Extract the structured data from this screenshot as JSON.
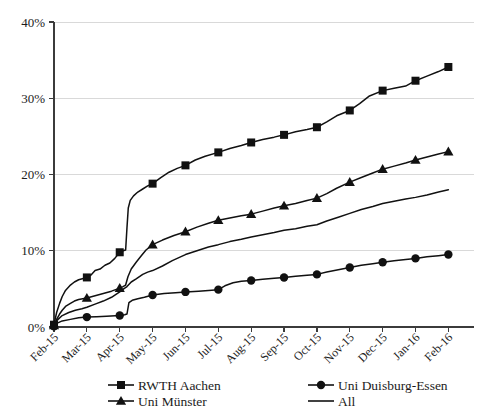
{
  "chart_data": {
    "type": "line",
    "title": "",
    "xlabel": "",
    "ylabel": "",
    "ylim": [
      0,
      40
    ],
    "ytick_labels": [
      "0%",
      "10%",
      "20%",
      "30%",
      "40%"
    ],
    "ytick_values": [
      0,
      10,
      20,
      30,
      40
    ],
    "grid": true,
    "legend_position": "bottom",
    "categories": [
      "Feb-15",
      "Mar-15",
      "Apr-15",
      "May-15",
      "Jun-15",
      "Jul-15",
      "Aug-15",
      "Sep-15",
      "Oct-15",
      "Nov-15",
      "Dec-15",
      "Jan-16",
      "Feb-16"
    ],
    "series": [
      {
        "name": "RWTH Aachen",
        "marker": "square",
        "values": [
          0.3,
          6.5,
          9.8,
          18.8,
          21.2,
          22.9,
          24.2,
          25.2,
          26.2,
          28.4,
          31.0,
          32.3,
          34.1
        ]
      },
      {
        "name": "Uni Münster",
        "marker": "triangle",
        "values": [
          0.2,
          3.8,
          5.1,
          10.8,
          12.5,
          14.0,
          14.8,
          15.9,
          16.9,
          19.0,
          20.7,
          21.9,
          23.0
        ]
      },
      {
        "name": "Uni Duisburg-Essen",
        "marker": "circle",
        "values": [
          0.1,
          1.3,
          1.5,
          4.2,
          4.6,
          4.9,
          6.1,
          6.5,
          6.9,
          7.8,
          8.5,
          9.0,
          9.5
        ]
      },
      {
        "name": "All",
        "marker": "none",
        "values": [
          0.2,
          2.6,
          4.6,
          7.4,
          9.5,
          10.8,
          11.8,
          12.7,
          13.4,
          14.9,
          16.2,
          17.0,
          18.0
        ]
      }
    ],
    "dense_points": {
      "RWTH Aachen": [
        [
          0.0,
          0.3
        ],
        [
          0.08,
          1.9
        ],
        [
          0.17,
          3.1
        ],
        [
          0.25,
          4.0
        ],
        [
          0.35,
          4.8
        ],
        [
          0.5,
          5.5
        ],
        [
          0.62,
          5.9
        ],
        [
          0.75,
          6.2
        ],
        [
          1.0,
          6.5
        ],
        [
          1.12,
          6.8
        ],
        [
          1.25,
          7.4
        ],
        [
          1.4,
          7.6
        ],
        [
          1.55,
          8.1
        ],
        [
          1.7,
          8.4
        ],
        [
          1.85,
          9.0
        ],
        [
          2.0,
          9.8
        ],
        [
          2.1,
          10.0
        ],
        [
          2.18,
          10.1
        ],
        [
          2.22,
          13.0
        ],
        [
          2.26,
          15.6
        ],
        [
          2.32,
          16.6
        ],
        [
          2.42,
          17.2
        ],
        [
          2.55,
          17.7
        ],
        [
          2.7,
          18.1
        ],
        [
          2.85,
          18.5
        ],
        [
          3.0,
          18.8
        ],
        [
          3.25,
          19.6
        ],
        [
          3.5,
          20.3
        ],
        [
          3.75,
          20.8
        ],
        [
          4.0,
          21.2
        ],
        [
          4.3,
          21.9
        ],
        [
          4.6,
          22.4
        ],
        [
          5.0,
          22.9
        ],
        [
          5.35,
          23.4
        ],
        [
          5.7,
          23.8
        ],
        [
          6.0,
          24.2
        ],
        [
          6.35,
          24.6
        ],
        [
          6.7,
          24.9
        ],
        [
          7.0,
          25.2
        ],
        [
          7.35,
          25.6
        ],
        [
          7.7,
          25.9
        ],
        [
          8.0,
          26.2
        ],
        [
          8.3,
          26.9
        ],
        [
          8.6,
          27.7
        ],
        [
          9.0,
          28.4
        ],
        [
          9.3,
          29.3
        ],
        [
          9.6,
          30.3
        ],
        [
          10.0,
          31.0
        ],
        [
          10.35,
          31.3
        ],
        [
          10.7,
          31.6
        ],
        [
          11.0,
          32.3
        ],
        [
          11.35,
          32.9
        ],
        [
          11.7,
          33.5
        ],
        [
          12.0,
          34.1
        ]
      ],
      "Uni Münster": [
        [
          0.0,
          0.2
        ],
        [
          0.08,
          1.0
        ],
        [
          0.17,
          1.7
        ],
        [
          0.25,
          2.2
        ],
        [
          0.35,
          2.7
        ],
        [
          0.5,
          3.1
        ],
        [
          0.62,
          3.4
        ],
        [
          0.75,
          3.6
        ],
        [
          1.0,
          3.8
        ],
        [
          1.25,
          4.1
        ],
        [
          1.5,
          4.4
        ],
        [
          1.75,
          4.7
        ],
        [
          2.0,
          5.1
        ],
        [
          2.1,
          5.3
        ],
        [
          2.18,
          5.5
        ],
        [
          2.25,
          6.6
        ],
        [
          2.35,
          7.6
        ],
        [
          2.5,
          8.5
        ],
        [
          2.65,
          9.3
        ],
        [
          2.8,
          10.1
        ],
        [
          3.0,
          10.8
        ],
        [
          3.3,
          11.4
        ],
        [
          3.65,
          12.0
        ],
        [
          4.0,
          12.5
        ],
        [
          4.35,
          13.1
        ],
        [
          4.7,
          13.6
        ],
        [
          5.0,
          14.0
        ],
        [
          5.35,
          14.3
        ],
        [
          5.7,
          14.6
        ],
        [
          6.0,
          14.8
        ],
        [
          6.35,
          15.2
        ],
        [
          6.7,
          15.6
        ],
        [
          7.0,
          15.9
        ],
        [
          7.35,
          16.2
        ],
        [
          7.7,
          16.6
        ],
        [
          8.0,
          16.9
        ],
        [
          8.3,
          17.5
        ],
        [
          8.6,
          18.2
        ],
        [
          9.0,
          19.0
        ],
        [
          9.35,
          19.6
        ],
        [
          9.7,
          20.2
        ],
        [
          10.0,
          20.7
        ],
        [
          10.35,
          21.1
        ],
        [
          10.7,
          21.5
        ],
        [
          11.0,
          21.9
        ],
        [
          11.35,
          22.3
        ],
        [
          11.7,
          22.7
        ],
        [
          12.0,
          23.0
        ]
      ],
      "Uni Duisburg-Essen": [
        [
          0.0,
          0.1
        ],
        [
          0.1,
          0.5
        ],
        [
          0.25,
          0.8
        ],
        [
          0.5,
          1.0
        ],
        [
          0.75,
          1.2
        ],
        [
          1.0,
          1.3
        ],
        [
          1.3,
          1.35
        ],
        [
          1.6,
          1.4
        ],
        [
          2.0,
          1.5
        ],
        [
          2.15,
          1.6
        ],
        [
          2.22,
          1.7
        ],
        [
          2.28,
          3.2
        ],
        [
          2.38,
          3.5
        ],
        [
          2.55,
          3.7
        ],
        [
          2.75,
          3.9
        ],
        [
          3.0,
          4.2
        ],
        [
          3.35,
          4.4
        ],
        [
          3.7,
          4.5
        ],
        [
          4.0,
          4.6
        ],
        [
          4.4,
          4.7
        ],
        [
          4.7,
          4.8
        ],
        [
          5.0,
          4.9
        ],
        [
          5.2,
          5.4
        ],
        [
          5.45,
          5.8
        ],
        [
          5.7,
          6.0
        ],
        [
          6.0,
          6.1
        ],
        [
          6.35,
          6.25
        ],
        [
          6.7,
          6.4
        ],
        [
          7.0,
          6.5
        ],
        [
          7.35,
          6.65
        ],
        [
          7.7,
          6.8
        ],
        [
          8.0,
          6.9
        ],
        [
          8.3,
          7.2
        ],
        [
          8.65,
          7.5
        ],
        [
          9.0,
          7.8
        ],
        [
          9.35,
          8.1
        ],
        [
          9.7,
          8.3
        ],
        [
          10.0,
          8.5
        ],
        [
          10.35,
          8.7
        ],
        [
          10.7,
          8.85
        ],
        [
          11.0,
          9.0
        ],
        [
          11.35,
          9.2
        ],
        [
          11.7,
          9.35
        ],
        [
          12.0,
          9.5
        ]
      ],
      "All": [
        [
          0.0,
          0.2
        ],
        [
          0.1,
          0.9
        ],
        [
          0.25,
          1.5
        ],
        [
          0.45,
          1.9
        ],
        [
          0.65,
          2.2
        ],
        [
          0.85,
          2.4
        ],
        [
          1.0,
          2.6
        ],
        [
          1.25,
          3.0
        ],
        [
          1.5,
          3.4
        ],
        [
          1.75,
          3.9
        ],
        [
          2.0,
          4.6
        ],
        [
          2.12,
          5.0
        ],
        [
          2.22,
          5.3
        ],
        [
          2.35,
          5.9
        ],
        [
          2.5,
          6.3
        ],
        [
          2.7,
          6.9
        ],
        [
          2.85,
          7.2
        ],
        [
          3.0,
          7.4
        ],
        [
          3.3,
          8.0
        ],
        [
          3.6,
          8.7
        ],
        [
          4.0,
          9.5
        ],
        [
          4.35,
          10.0
        ],
        [
          4.7,
          10.5
        ],
        [
          5.0,
          10.8
        ],
        [
          5.35,
          11.2
        ],
        [
          5.7,
          11.5
        ],
        [
          6.0,
          11.8
        ],
        [
          6.35,
          12.1
        ],
        [
          6.7,
          12.4
        ],
        [
          7.0,
          12.7
        ],
        [
          7.35,
          12.9
        ],
        [
          7.7,
          13.2
        ],
        [
          8.0,
          13.4
        ],
        [
          8.3,
          13.9
        ],
        [
          8.65,
          14.4
        ],
        [
          9.0,
          14.9
        ],
        [
          9.35,
          15.4
        ],
        [
          9.7,
          15.8
        ],
        [
          10.0,
          16.2
        ],
        [
          10.35,
          16.5
        ],
        [
          10.7,
          16.8
        ],
        [
          11.0,
          17.0
        ],
        [
          11.35,
          17.3
        ],
        [
          11.7,
          17.7
        ],
        [
          12.0,
          18.0
        ]
      ]
    },
    "legend": [
      {
        "label": "RWTH Aachen",
        "marker": "square"
      },
      {
        "label": "Uni Duisburg-Essen",
        "marker": "circle"
      },
      {
        "label": "Uni Münster",
        "marker": "triangle"
      },
      {
        "label": "All",
        "marker": "none"
      }
    ],
    "colors": {
      "series": "#111111",
      "grid": "#d9d9d9",
      "axis": "#3b3b3b",
      "background": "#ffffff"
    }
  }
}
